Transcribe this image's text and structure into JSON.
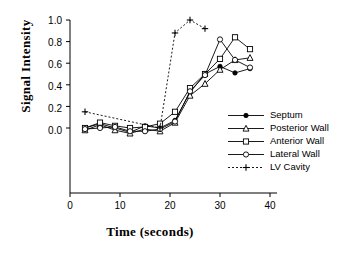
{
  "chart_data": {
    "type": "line",
    "title": "",
    "xlabel": "Time  (seconds)",
    "ylabel": "Signal  Intensity",
    "xlim": [
      0,
      40
    ],
    "ylim": [
      -0.12,
      1.05
    ],
    "xticks": [
      0,
      10,
      20,
      30,
      40
    ],
    "xtick_labels": [
      "0",
      "10",
      "20",
      "30",
      "40"
    ],
    "yticks": [
      0.0,
      0.2,
      0.4,
      0.6,
      0.8,
      1.0
    ],
    "ytick_labels": [
      "0.0",
      "0.2",
      "0.4",
      "0.6",
      "0.8",
      "1.0"
    ],
    "grid": false,
    "legend_position": "right-inside",
    "series": [
      {
        "name": "Septum",
        "marker": "filled-circle",
        "line": "solid",
        "color": "#000000",
        "x": [
          3,
          6,
          9,
          12,
          15,
          18,
          21,
          24,
          27,
          30,
          33,
          36
        ],
        "y": [
          0.0,
          0.04,
          0.0,
          -0.04,
          0.02,
          0.0,
          0.07,
          0.33,
          0.5,
          0.57,
          0.51,
          0.55
        ]
      },
      {
        "name": "Posterior Wall",
        "marker": "open-triangle",
        "line": "solid",
        "color": "#000000",
        "x": [
          3,
          6,
          9,
          12,
          15,
          18,
          21,
          24,
          27,
          30,
          33,
          36
        ],
        "y": [
          -0.02,
          0.03,
          -0.02,
          -0.05,
          -0.01,
          -0.03,
          0.05,
          0.3,
          0.41,
          0.54,
          0.63,
          0.65
        ]
      },
      {
        "name": "Anterior Wall",
        "marker": "open-square",
        "line": "solid",
        "color": "#000000",
        "x": [
          3,
          6,
          9,
          12,
          15,
          18,
          21,
          24,
          27,
          30,
          33,
          36
        ],
        "y": [
          0.0,
          0.05,
          0.02,
          0.0,
          0.01,
          0.04,
          0.15,
          0.37,
          0.5,
          0.64,
          0.84,
          0.73
        ]
      },
      {
        "name": "Lateral Wall",
        "marker": "open-circle",
        "line": "solid",
        "color": "#000000",
        "x": [
          3,
          6,
          9,
          12,
          15,
          18,
          21,
          24,
          27,
          30,
          33,
          36
        ],
        "y": [
          -0.01,
          0.0,
          0.01,
          -0.03,
          -0.03,
          -0.01,
          0.06,
          0.34,
          0.49,
          0.82,
          0.63,
          0.56
        ]
      },
      {
        "name": "LV Cavity",
        "marker": "plus",
        "line": "dotted",
        "color": "#000000",
        "x": [
          3,
          18,
          21,
          24,
          27
        ],
        "y": [
          0.15,
          0.0,
          0.88,
          1.0,
          0.92
        ]
      }
    ]
  },
  "legend": {
    "items": [
      {
        "label": "Septum",
        "marker": "filled-circle",
        "line": "solid"
      },
      {
        "label": "Posterior Wall",
        "marker": "open-triangle",
        "line": "solid"
      },
      {
        "label": "Anterior Wall",
        "marker": "open-square",
        "line": "solid"
      },
      {
        "label": "Lateral Wall",
        "marker": "open-circle",
        "line": "solid"
      },
      {
        "label": "LV Cavity",
        "marker": "plus",
        "line": "dotted"
      }
    ]
  }
}
